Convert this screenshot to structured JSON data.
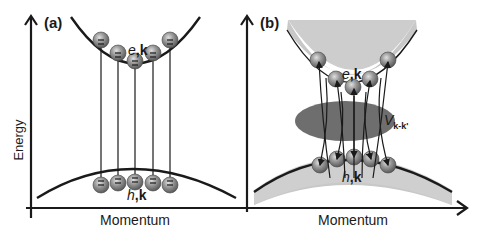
{
  "panels": [
    {
      "id": "a",
      "tag": "(a)",
      "y_axis_label": "Energy",
      "x_axis_label": "Momentum",
      "conduction_label_italic": "e",
      "conduction_label_bold": ",k",
      "valence_label_italic": "h",
      "valence_label_bold": ",k",
      "description": "Non-interacting picture: vertical optical transitions between electrons and holes at the same k"
    },
    {
      "id": "b",
      "tag": "(b)",
      "x_axis_label": "Momentum",
      "conduction_label_italic": "e",
      "conduction_label_bold": ",k",
      "valence_label_italic": "h",
      "valence_label_bold": ",k",
      "interaction_label": "V",
      "interaction_subscript": "k-k'",
      "description": "Coulomb-interacting picture: transitions mixed through interaction V_k-k'"
    }
  ],
  "colors": {
    "line": "#1a1a1a",
    "band_shade": "#c8c8c8",
    "particle_fill": "#8a8a8a",
    "particle_highlight": "#d0d0d0",
    "interaction_ellipse": "#6e6e6e"
  }
}
